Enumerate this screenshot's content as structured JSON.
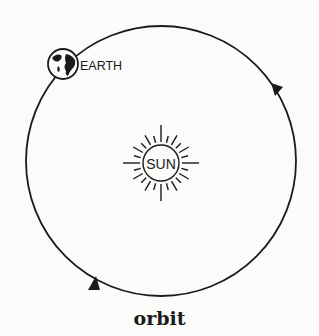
{
  "diagram": {
    "caption": "orbit",
    "earth_label": "EARTH",
    "sun_label": "SUN",
    "colors": {
      "line": "#1a1a1a",
      "background": "#fbfbf9"
    }
  }
}
